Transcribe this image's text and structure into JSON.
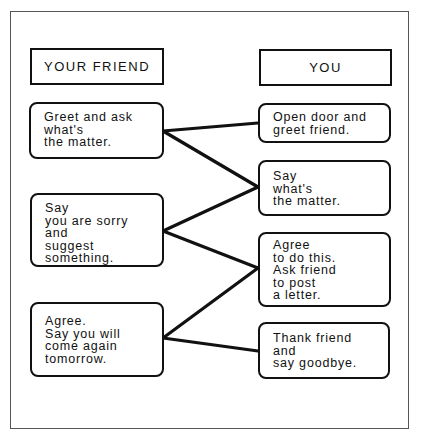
{
  "headers": {
    "friend": "YOUR FRIEND",
    "you": "YOU"
  },
  "friend_boxes": [
    {
      "text": "Greet and ask\nwhat's\nthe matter."
    },
    {
      "text": "Say\nyou are sorry\nand\nsuggest\nsomething."
    },
    {
      "text": "Agree.\nSay you will\ncome again\ntomorrow."
    }
  ],
  "you_boxes": [
    {
      "text": "Open door and\ngreet friend."
    },
    {
      "text": "Say\nwhat's\nthe matter."
    },
    {
      "text": "Agree\nto do this.\nAsk friend\nto post\na letter."
    },
    {
      "text": "Thank friend\nand\nsay goodbye."
    }
  ],
  "connections": [
    {
      "from": "friend_boxes.0",
      "to": "you_boxes.0"
    },
    {
      "from": "friend_boxes.0",
      "to": "you_boxes.1"
    },
    {
      "from": "friend_boxes.1",
      "to": "you_boxes.1"
    },
    {
      "from": "friend_boxes.1",
      "to": "you_boxes.2"
    },
    {
      "from": "friend_boxes.2",
      "to": "you_boxes.2"
    },
    {
      "from": "friend_boxes.2",
      "to": "you_boxes.3"
    }
  ]
}
